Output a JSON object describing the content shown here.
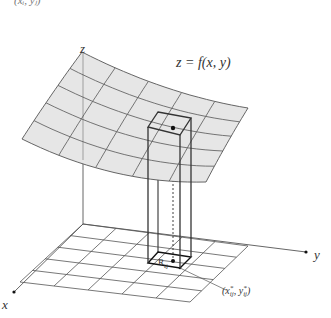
{
  "figure": {
    "cropped_top_text": "(xᵢ, yⱼ)",
    "surface_label": "z = f(x, y)",
    "axis_labels": {
      "x": "x",
      "y": "y",
      "z": "z"
    },
    "region_label": "R",
    "region_sub": "ij",
    "point_label_parts": {
      "open": "(",
      "x": "x",
      "sep": ", ",
      "y": "y",
      "close": ")",
      "sup": "*",
      "sub": "ij"
    },
    "colors": {
      "surface_fill": "#e6e6e6",
      "line": "#555555",
      "column": "#333333",
      "dark": "#111111"
    },
    "grid": {
      "rows": 5,
      "cols": 5
    },
    "surface_corners": {
      "back_left": [
        82,
        52
      ],
      "back_right": [
        248,
        108
      ],
      "front_left": [
        22,
        139
      ],
      "front_right": [
        206,
        182
      ],
      "sag": 12
    },
    "floor_corners": {
      "back_left": [
        83,
        224
      ],
      "back_right": [
        248,
        246
      ],
      "front_left": [
        20,
        282
      ],
      "front_right": [
        190,
        302
      ]
    },
    "axes": {
      "origin": [
        83,
        224
      ],
      "z_end": [
        83,
        68
      ],
      "x_end": [
        14,
        292
      ],
      "y_end": [
        306,
        252
      ]
    },
    "column": {
      "top": [
        [
          158,
          112
        ],
        [
          191,
          118
        ],
        [
          180,
          135
        ],
        [
          148,
          127
        ]
      ],
      "bottom": [
        [
          158,
          252
        ],
        [
          191,
          257
        ],
        [
          180,
          268
        ],
        [
          148,
          263
        ]
      ],
      "top_point": [
        173,
        128
      ],
      "base_point": [
        173,
        263
      ],
      "leader_end": [
        226,
        290
      ]
    }
  }
}
